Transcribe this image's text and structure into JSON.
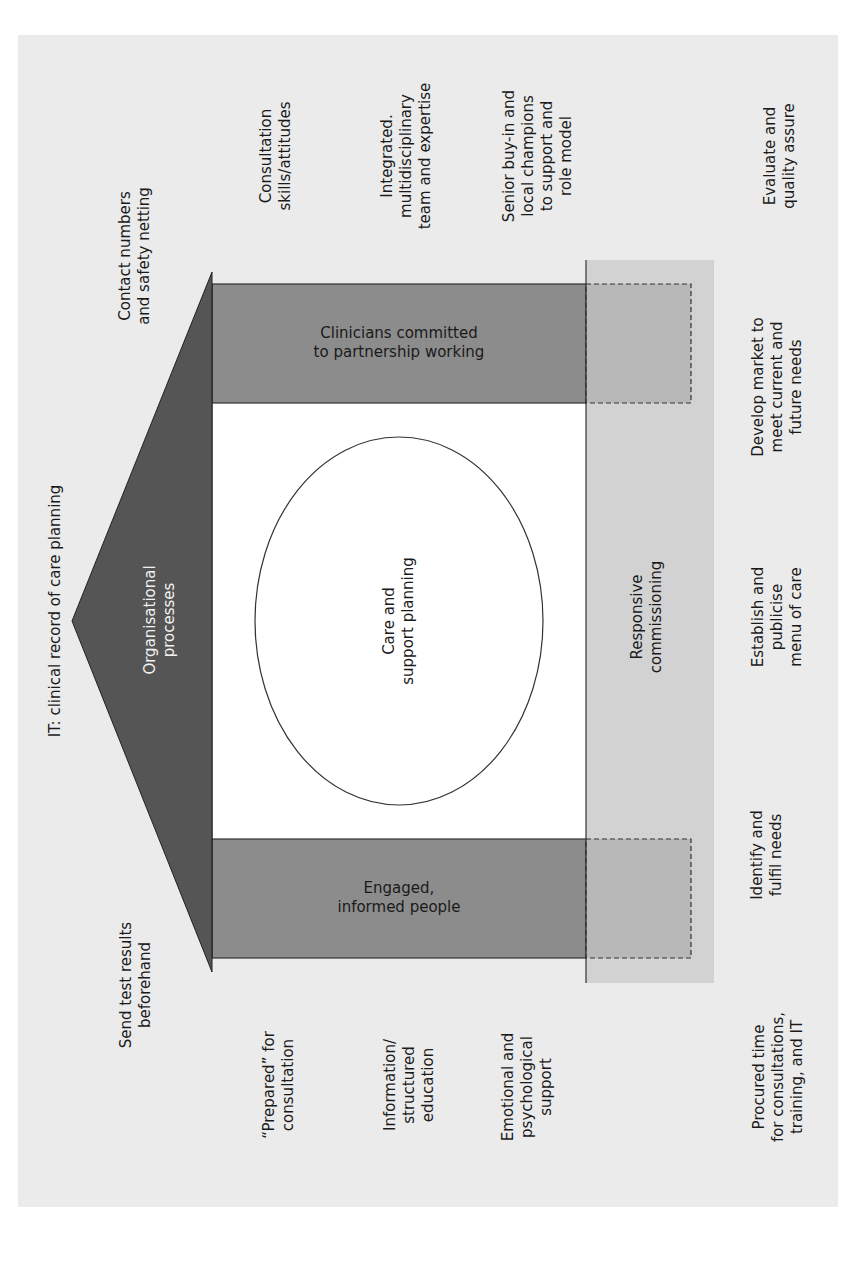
{
  "diagram": {
    "type": "house-model",
    "orientation": "rotated 90 degrees counter-clockwise",
    "colors": {
      "background": "#ebebeb",
      "roof": "#555555",
      "pillars": "#8c8c8c",
      "foundation": "#d2d2d2",
      "body": "#ffffff",
      "outline": "#222222"
    },
    "roof": {
      "label": "Organisational\nprocesses",
      "top_annotation": "IT: clinical record of care planning",
      "left_annotation": "Send test results\nbeforehand",
      "right_annotation": "Contact numbers\nand safety netting"
    },
    "centre": {
      "label": "Care and\nsupport planning"
    },
    "pillars": {
      "left": {
        "label": "Engaged,\ninformed people",
        "annotations": [
          "“Prepared” for\nconsultation",
          "Information/\nstructured\neducation",
          "Emotional and\npsychological\nsupport"
        ]
      },
      "right": {
        "label": "Clinicians committed\nto partnership working",
        "annotations": [
          "Consultation\nskills/attitudes",
          "Integrated.\nmultidisciplinary\nteam and expertise",
          "Senior buy-in and\nlocal champions\nto support and\nrole model"
        ]
      }
    },
    "foundation": {
      "label": "Responsive\ncommissioning",
      "annotations": [
        "Evaluate and\nquality assure",
        "Develop market to\nmeet current and\nfuture needs",
        "Establish and\npublicise\nmenu of care",
        "Identify and\nfulfil needs",
        "Procured time\nfor consultations,\ntraining, and IT"
      ]
    }
  }
}
